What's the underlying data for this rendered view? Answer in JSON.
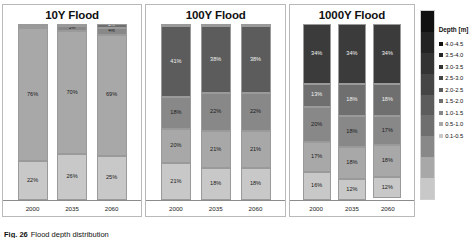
{
  "caption": {
    "figure_number": "Fig. 26",
    "text": "Flood depth distribution"
  },
  "legend": {
    "title": "Depth [m]",
    "items": [
      {
        "label": "4.0-4.5",
        "color": "#111111"
      },
      {
        "label": "3.5-4.0",
        "color": "#232323"
      },
      {
        "label": "3.0-3.5",
        "color": "#333333"
      },
      {
        "label": "2.5-3.0",
        "color": "#454545"
      },
      {
        "label": "2.0-2.5",
        "color": "#5c5c5c"
      },
      {
        "label": "1.5-2.0",
        "color": "#6f6f6f"
      },
      {
        "label": "1.0-1.5",
        "color": "#888888"
      },
      {
        "label": "0.5-1.0",
        "color": "#a8a8a8"
      },
      {
        "label": "0.1-0.5",
        "color": "#c8c8c8"
      }
    ]
  },
  "chart_data": [
    {
      "type": "bar",
      "title": "10Y Flood",
      "stacked": true,
      "xlabel": "",
      "ylabel": "",
      "ylim": [
        0,
        100
      ],
      "categories": [
        "2000",
        "2035",
        "2060"
      ],
      "series": [
        {
          "name": "0.1-0.5",
          "color": "#c8c8c8",
          "values": [
            22,
            26,
            25
          ],
          "labels": [
            "22%",
            "26%",
            "25%"
          ]
        },
        {
          "name": "0.5-1.0",
          "color": "#a8a8a8",
          "values": [
            76,
            70,
            69
          ],
          "labels": [
            "76%",
            "70%",
            "69%"
          ]
        },
        {
          "name": "1.0-1.5",
          "color": "#888888",
          "values": [
            1,
            3,
            4
          ],
          "labels": [
            "1%",
            "3%",
            "4%"
          ]
        },
        {
          "name": "1.5-2.0",
          "color": "#6f6f6f",
          "values": [
            1,
            1,
            2
          ],
          "labels": [
            "1%",
            "1%",
            "2%"
          ]
        }
      ]
    },
    {
      "type": "bar",
      "title": "100Y Flood",
      "stacked": true,
      "xlabel": "",
      "ylabel": "",
      "ylim": [
        0,
        100
      ],
      "categories": [
        "2000",
        "2035",
        "2060"
      ],
      "series": [
        {
          "name": "0.1-0.5",
          "color": "#c8c8c8",
          "values": [
            21,
            18,
            18
          ],
          "labels": [
            "21%",
            "18%",
            "18%"
          ]
        },
        {
          "name": "0.5-1.0",
          "color": "#a8a8a8",
          "values": [
            20,
            21,
            21
          ],
          "labels": [
            "20%",
            "21%",
            "21%"
          ]
        },
        {
          "name": "1.0-1.5",
          "color": "#888888",
          "values": [
            18,
            22,
            22
          ],
          "labels": [
            "18%",
            "22%",
            "22%"
          ]
        },
        {
          "name": "1.5-2.0",
          "color": "#5c5c5c",
          "values": [
            41,
            38,
            38
          ],
          "labels": [
            "41%",
            "38%",
            "38%"
          ]
        },
        {
          "name": "2.0-2.5",
          "color": "#454545",
          "values": [
            0,
            1,
            1
          ],
          "labels": [
            "0%",
            "0%",
            "0%"
          ]
        }
      ]
    },
    {
      "type": "bar",
      "title": "1000Y Flood",
      "stacked": true,
      "xlabel": "",
      "ylabel": "",
      "ylim": [
        0,
        100
      ],
      "categories": [
        "2000",
        "2035",
        "2060"
      ],
      "series": [
        {
          "name": "0.1-0.5",
          "color": "#c8c8c8",
          "values": [
            16,
            12,
            12
          ],
          "labels": [
            "16%",
            "12%",
            "12%"
          ]
        },
        {
          "name": "0.5-1.0",
          "color": "#a8a8a8",
          "values": [
            17,
            18,
            18
          ],
          "labels": [
            "17%",
            "18%",
            "18%"
          ]
        },
        {
          "name": "1.0-1.5",
          "color": "#888888",
          "values": [
            20,
            18,
            17
          ],
          "labels": [
            "20%",
            "18%",
            "17%"
          ]
        },
        {
          "name": "1.5-2.0",
          "color": "#6f6f6f",
          "values": [
            13,
            18,
            18
          ],
          "labels": [
            "13%",
            "18%",
            "18%"
          ]
        },
        {
          "name": "2.0-2.5",
          "color": "#3b3b3b",
          "values": [
            34,
            34,
            34
          ],
          "labels": [
            "34%",
            "34%",
            "34%"
          ]
        }
      ]
    }
  ]
}
